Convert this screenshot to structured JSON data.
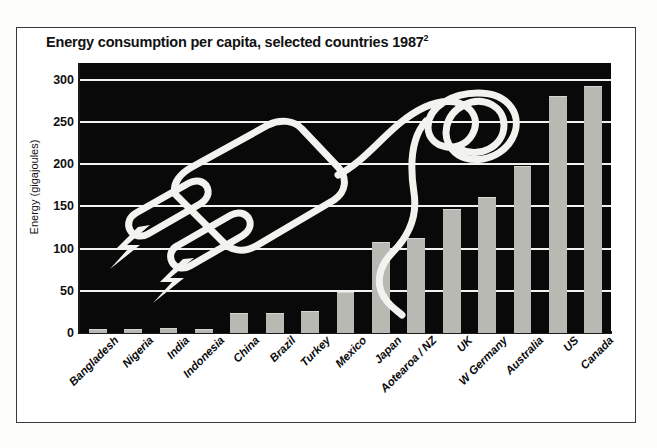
{
  "figure": {
    "title_main": "Energy consumption per capita, selected countries 1987",
    "title_sup": "2"
  },
  "chart_data": {
    "type": "bar",
    "xlabel": "",
    "ylabel": "Energy (gigajoules)",
    "ylim": [
      0,
      320
    ],
    "yticks": [
      0,
      50,
      100,
      150,
      200,
      250,
      300
    ],
    "ytick_labels": [
      "0",
      "50",
      "100",
      "150",
      "200",
      "250",
      "300"
    ],
    "grid": true,
    "legend": "none",
    "plot_background": "#090909",
    "bar_color": "#b9b9b4",
    "gridline_color": "#f2f2ee",
    "categories": [
      "Bangladesh",
      "Nigeria",
      "India",
      "Indonesia",
      "China",
      "Brazil",
      "Turkey",
      "Mexico",
      "Japan",
      "Aotearoa / NZ",
      "UK",
      "W Germany",
      "Australia",
      "US",
      "Canada"
    ],
    "values": [
      3,
      4,
      5,
      4,
      22,
      22,
      25,
      48,
      107,
      112,
      146,
      160,
      197,
      280,
      292
    ],
    "annotations": [
      "decorative white line-art drawing of an electrical plug with cord",
      "two white lightning-bolt symbols over the left of the plot"
    ]
  }
}
